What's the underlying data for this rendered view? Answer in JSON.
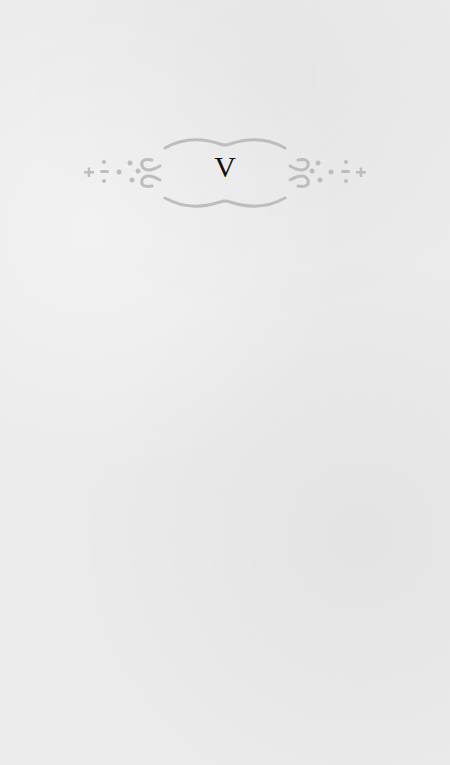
{
  "chapter": {
    "number": "V"
  },
  "ornament": {
    "icon": "decorative-frame-icon",
    "color": "#bdbdbd"
  },
  "page": {
    "background": "#ebebeb"
  }
}
